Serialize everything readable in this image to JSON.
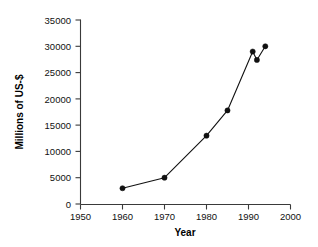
{
  "chart_data": {
    "type": "line",
    "title": "",
    "xlabel": "Year",
    "ylabel": "Millions of US-$",
    "xlim": [
      1950,
      2000
    ],
    "ylim": [
      0,
      35000
    ],
    "grid": false,
    "legend": null,
    "x": [
      1960,
      1970,
      1980,
      1985,
      1991,
      1992,
      1994
    ],
    "values": [
      3000,
      5000,
      13000,
      17800,
      29000,
      27400,
      30000
    ],
    "points": [
      {
        "x": 1960,
        "y": 3000
      },
      {
        "x": 1970,
        "y": 5000
      },
      {
        "x": 1980,
        "y": 13000
      },
      {
        "x": 1985,
        "y": 17800
      },
      {
        "x": 1991,
        "y": 29000
      },
      {
        "x": 1992,
        "y": 27400
      },
      {
        "x": 1994,
        "y": 30000
      }
    ],
    "x_ticks": [
      1950,
      1960,
      1970,
      1980,
      1990,
      2000
    ],
    "x_tick_labels": [
      "1950",
      "1960",
      "1970",
      "1980",
      "1990",
      "2000"
    ],
    "y_ticks": [
      0,
      5000,
      10000,
      15000,
      20000,
      25000,
      30000,
      35000
    ],
    "y_tick_labels": [
      "0",
      "5000",
      "10000",
      "15000",
      "20000",
      "25000",
      "30000",
      "35000"
    ],
    "series_color": "#111111",
    "marker": "circle",
    "marker_color": "#111111"
  },
  "axes": {
    "x_title": "Year",
    "y_title": "Millions of US-$"
  }
}
